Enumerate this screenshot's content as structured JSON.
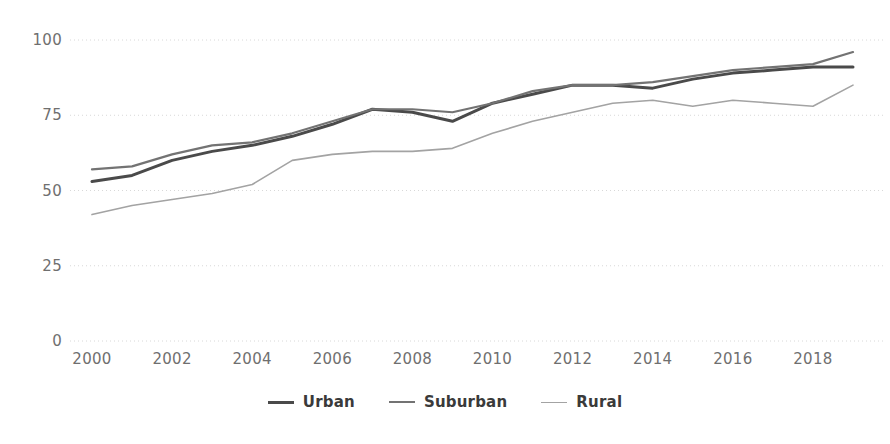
{
  "chart_data": {
    "type": "line",
    "title": "",
    "subtitle": "",
    "xlabel": "",
    "ylabel": "",
    "xlim": [
      2000,
      2019
    ],
    "ylim": [
      0,
      100
    ],
    "grid": true,
    "grid_axis": "y",
    "legend_position": "bottom",
    "x": [
      2000,
      2001,
      2002,
      2003,
      2004,
      2005,
      2006,
      2007,
      2008,
      2009,
      2010,
      2011,
      2012,
      2013,
      2014,
      2015,
      2016,
      2017,
      2018,
      2019
    ],
    "yticks": [
      0,
      25,
      50,
      75,
      100
    ],
    "ytick_labels": [
      "0",
      "25",
      "50",
      "75",
      "100"
    ],
    "xticks": [
      2000,
      2002,
      2004,
      2006,
      2008,
      2010,
      2012,
      2014,
      2016,
      2018
    ],
    "xtick_labels": [
      "2000",
      "2002",
      "2004",
      "2006",
      "2008",
      "2010",
      "2012",
      "2014",
      "2016",
      "2018"
    ],
    "series": [
      {
        "name": "Urban",
        "color": "#4a4a4a",
        "width": 3.0,
        "values": [
          53,
          55,
          60,
          63,
          65,
          68,
          72,
          77,
          76,
          73,
          79,
          82,
          85,
          85,
          84,
          87,
          89,
          90,
          91,
          91
        ]
      },
      {
        "name": "Suburban",
        "color": "#737373",
        "width": 2.2,
        "values": [
          57,
          58,
          62,
          65,
          66,
          69,
          73,
          77,
          77,
          76,
          79,
          83,
          85,
          85,
          86,
          88,
          90,
          91,
          92,
          96
        ]
      },
      {
        "name": "Rural",
        "color": "#a3a3a3",
        "width": 1.6,
        "values": [
          42,
          45,
          47,
          49,
          52,
          60,
          62,
          63,
          63,
          64,
          69,
          73,
          76,
          79,
          80,
          78,
          80,
          79,
          78,
          85
        ]
      }
    ]
  },
  "axis": {
    "tick_color": "#6f6f6f",
    "gridline_color": "#d8d8d8"
  },
  "legend": {
    "items": [
      {
        "label": "Urban"
      },
      {
        "label": "Suburban"
      },
      {
        "label": "Rural"
      }
    ]
  }
}
